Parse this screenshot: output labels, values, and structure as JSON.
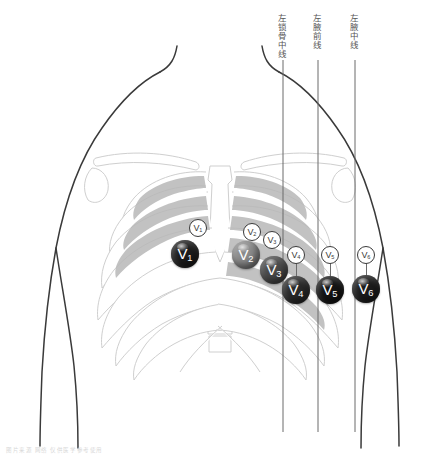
{
  "figure": {
    "background_color": "#ffffff"
  },
  "landmark_lines": [
    {
      "id": "midclavicular",
      "label": "左锁骨中线",
      "x": 283,
      "label_top": 14,
      "line_top": 60,
      "line_bottom": 432,
      "color": "#6b6b6b"
    },
    {
      "id": "anterior-axillary",
      "label": "左腋前线",
      "x": 318,
      "label_top": 14,
      "line_top": 60,
      "line_bottom": 432,
      "color": "#6b6b6b"
    },
    {
      "id": "midaxillary",
      "label": "左腋中线",
      "x": 355,
      "label_top": 14,
      "line_top": 60,
      "line_bottom": 432,
      "color": "#6b6b6b"
    }
  ],
  "electrodes": [
    {
      "id": "V1",
      "letter": "V",
      "subscript": "1",
      "cx": 185,
      "cy": 254,
      "r": 14,
      "style": "filled",
      "color": "#1c1c1c"
    },
    {
      "id": "V2",
      "letter": "V",
      "subscript": "2",
      "cx": 246,
      "cy": 255,
      "r": 14,
      "style": "filled",
      "color": "#8c8c8c"
    },
    {
      "id": "V3",
      "letter": "V",
      "subscript": "3",
      "cx": 274,
      "cy": 270,
      "r": 14,
      "style": "filled",
      "color": "#4a4a4a"
    },
    {
      "id": "V4",
      "letter": "V",
      "subscript": "4",
      "cx": 296,
      "cy": 290,
      "r": 14,
      "style": "filled",
      "color": "#2a2a2a"
    },
    {
      "id": "V5",
      "letter": "V",
      "subscript": "5",
      "cx": 330,
      "cy": 290,
      "r": 14,
      "style": "filled",
      "color": "#141414"
    },
    {
      "id": "V6",
      "letter": "V",
      "subscript": "6",
      "cx": 366,
      "cy": 289,
      "r": 14,
      "style": "filled",
      "color": "#1c1c1c"
    }
  ],
  "reference_markers": [
    {
      "id": "V1-ref",
      "letter": "V",
      "subscript": "1",
      "cx": 198,
      "cy": 228,
      "r": 9,
      "stem_to": null
    },
    {
      "id": "V2-ref",
      "letter": "V",
      "subscript": "2",
      "cx": 252,
      "cy": 232,
      "r": 9,
      "stem_to": null
    },
    {
      "id": "V3-ref",
      "letter": "V",
      "subscript": "3",
      "cx": 272,
      "cy": 240,
      "r": 9,
      "stem_to": null
    },
    {
      "id": "V4-ref",
      "letter": "V",
      "subscript": "4",
      "cx": 296,
      "cy": 255,
      "r": 9,
      "stem_to": 290
    },
    {
      "id": "V5-ref",
      "letter": "V",
      "subscript": "5",
      "cx": 330,
      "cy": 255,
      "r": 9,
      "stem_to": 290
    },
    {
      "id": "V6-ref",
      "letter": "V",
      "subscript": "6",
      "cx": 366,
      "cy": 255,
      "r": 9,
      "stem_to": 289
    }
  ],
  "watermark": {
    "text": "图片来源  网络   仅供医学参考使用",
    "x": 6,
    "y": 446
  },
  "colors": {
    "body_outline": "#3a3a3a",
    "skeleton_stroke": "#cfcfcf",
    "skeleton_shade": "#b3b3b3",
    "landmark_line": "#6b6b6b",
    "marker_outline": "#3a3a3a"
  }
}
